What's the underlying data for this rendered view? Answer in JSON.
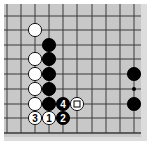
{
  "diagram": {
    "type": "go-board-fragment",
    "colors": {
      "board": "#c8c8c8",
      "board_edge": "#dcdcdc",
      "line": "#3a3a3a",
      "black": "#000000",
      "white": "#ffffff"
    },
    "grid": {
      "columns_x": [
        7,
        21,
        35,
        49,
        63,
        77,
        92,
        106,
        120,
        134
      ],
      "rows_y": [
        16,
        30,
        45,
        59,
        74,
        89,
        104,
        118,
        133
      ]
    },
    "stones": [
      {
        "color": "white",
        "col": 2,
        "row": 1,
        "label": ""
      },
      {
        "color": "black",
        "col": 3,
        "row": 2,
        "label": ""
      },
      {
        "color": "white",
        "col": 2,
        "row": 3,
        "label": ""
      },
      {
        "color": "black",
        "col": 3,
        "row": 3,
        "label": ""
      },
      {
        "color": "white",
        "col": 2,
        "row": 4,
        "label": ""
      },
      {
        "color": "black",
        "col": 3,
        "row": 4,
        "label": ""
      },
      {
        "color": "white",
        "col": 2,
        "row": 5,
        "label": ""
      },
      {
        "color": "black",
        "col": 3,
        "row": 5,
        "label": ""
      },
      {
        "color": "white",
        "col": 2,
        "row": 6,
        "label": ""
      },
      {
        "color": "black",
        "col": 3,
        "row": 6,
        "label": ""
      },
      {
        "color": "black",
        "col": 4,
        "row": 6,
        "label": "4"
      },
      {
        "color": "white",
        "col": 5,
        "row": 6,
        "label": "",
        "marker": "square"
      },
      {
        "color": "white",
        "col": 2,
        "row": 7,
        "label": "3"
      },
      {
        "color": "white",
        "col": 3,
        "row": 7,
        "label": "1"
      },
      {
        "color": "black",
        "col": 4,
        "row": 7,
        "label": "2"
      },
      {
        "color": "black",
        "col": 9,
        "row": 4,
        "label": ""
      },
      {
        "color": "black",
        "col": 9,
        "row": 6,
        "label": ""
      }
    ],
    "star_points": [
      {
        "col": 9,
        "row": 5
      }
    ]
  }
}
